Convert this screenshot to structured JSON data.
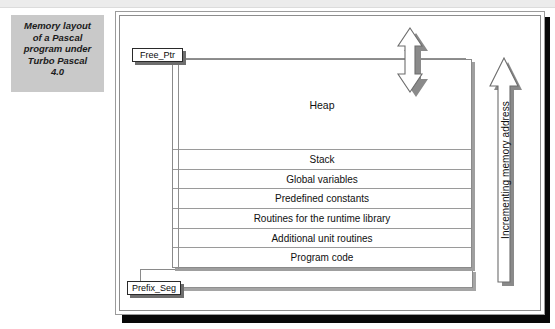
{
  "caption": {
    "text": "Memory layout\nof a Pascal\nprogram under\nTurbo Pascal\n4.0"
  },
  "diagram": {
    "title": "Memory layout of a Pascal program under Turbo Pascal 4.0",
    "memory_blocks": [
      {
        "label": "Heap",
        "kind": "heap"
      },
      {
        "label": "Stack",
        "kind": "std"
      },
      {
        "label": "Global variables",
        "kind": "std"
      },
      {
        "label": "Predefined constants",
        "kind": "std"
      },
      {
        "label": "Routines for the runtime library",
        "kind": "std"
      },
      {
        "label": "Additional unit routines",
        "kind": "std"
      },
      {
        "label": "Program code",
        "kind": "std"
      }
    ],
    "psp_block": {
      "label": ""
    },
    "pointers": {
      "free_ptr": "Free_Ptr",
      "prefix_seg": "Prefix_Seg"
    },
    "axis_label": "Incrementing memory address",
    "icons": {
      "heap_growth": "double-headed-vertical-arrow",
      "address_direction": "up-arrow"
    },
    "colors": {
      "frame_border": "#9b9b9b",
      "frame_shadow": "#080808",
      "caption_bg": "#c9c9c9",
      "table_line": "#9a9a9a",
      "callout_shadow": "#6e6e6e",
      "arrow_shadow": "#8f8f8f"
    }
  }
}
